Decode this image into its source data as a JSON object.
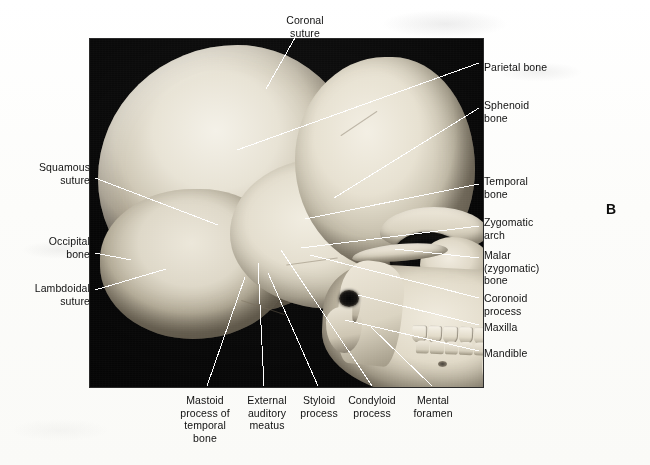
{
  "figure": {
    "letter": "B",
    "caption_labels_present": true
  },
  "photo": {
    "subject": "lateral view of human skull",
    "background_color": "#0a0a0a",
    "bone_color": "#e8e3d5"
  },
  "labels": {
    "top": [
      {
        "id": "coronal-suture",
        "text": "Coronal\nsuture",
        "align": "center",
        "x": 305,
        "y": 14
      }
    ],
    "right": [
      {
        "id": "parietal-bone",
        "text": "Parietal bone",
        "align": "left",
        "x": 484,
        "y": 61
      },
      {
        "id": "sphenoid-bone",
        "text": "Sphenoid\nbone",
        "align": "left",
        "x": 484,
        "y": 99
      },
      {
        "id": "temporal-bone",
        "text": "Temporal\nbone",
        "align": "left",
        "x": 484,
        "y": 175
      },
      {
        "id": "zygomatic-arch",
        "text": "Zygomatic\narch",
        "align": "left",
        "x": 484,
        "y": 216
      },
      {
        "id": "malar-zygomatic-bone",
        "text": "Malar\n(zygomatic)\nbone",
        "align": "left",
        "x": 484,
        "y": 249
      },
      {
        "id": "coronoid-process",
        "text": "Coronoid\nprocess",
        "align": "left",
        "x": 484,
        "y": 292
      },
      {
        "id": "maxilla",
        "text": "Maxilla",
        "align": "left",
        "x": 484,
        "y": 321
      },
      {
        "id": "mandible",
        "text": "Mandible",
        "align": "left",
        "x": 484,
        "y": 347
      }
    ],
    "left": [
      {
        "id": "squamous-suture",
        "text": "Squamous\nsuture",
        "align": "right",
        "x": 90,
        "y": 161
      },
      {
        "id": "occipital-bone",
        "text": "Occipital\nbone",
        "align": "right",
        "x": 90,
        "y": 235
      },
      {
        "id": "lambdoidal-suture",
        "text": "Lambdoidal\nsuture",
        "align": "right",
        "x": 90,
        "y": 282
      }
    ],
    "bottom": [
      {
        "id": "mastoid-process-of-temporal-bone",
        "text": "Mastoid\nprocess of\ntemporal\nbone",
        "align": "center",
        "x": 205,
        "y": 394
      },
      {
        "id": "external-auditory-meatus",
        "text": "External\nauditory\nmeatus",
        "align": "center",
        "x": 267,
        "y": 394
      },
      {
        "id": "styloid-process",
        "text": "Styloid\nprocess",
        "align": "center",
        "x": 319,
        "y": 394
      },
      {
        "id": "condyloid-process",
        "text": "Condyloid\nprocess",
        "align": "center",
        "x": 372,
        "y": 394
      },
      {
        "id": "mental-foramen",
        "text": "Mental\nforamen",
        "align": "center",
        "x": 433,
        "y": 394
      }
    ]
  },
  "leaders": [
    {
      "id": "leader-coronal-suture",
      "x1": 296,
      "y1": 36,
      "x2": 266,
      "y2": 89,
      "color": "#ffffff"
    },
    {
      "id": "leader-parietal-bone",
      "x1": 479,
      "y1": 63,
      "x2": 237,
      "y2": 150,
      "color": "#ffffff"
    },
    {
      "id": "leader-sphenoid-bone",
      "x1": 479,
      "y1": 108,
      "x2": 334,
      "y2": 198,
      "color": "#ffffff"
    },
    {
      "id": "leader-temporal-bone",
      "x1": 479,
      "y1": 184,
      "x2": 305,
      "y2": 219,
      "color": "#ffffff"
    },
    {
      "id": "leader-zygomatic-arch",
      "x1": 479,
      "y1": 226,
      "x2": 301,
      "y2": 248,
      "color": "#ffffff"
    },
    {
      "id": "leader-malar-bone",
      "x1": 479,
      "y1": 258,
      "x2": 395,
      "y2": 249,
      "color": "#ffffff"
    },
    {
      "id": "leader-coronoid-process",
      "x1": 479,
      "y1": 298,
      "x2": 310,
      "y2": 255,
      "color": "#ffffff"
    },
    {
      "id": "leader-maxilla",
      "x1": 479,
      "y1": 325,
      "x2": 358,
      "y2": 295,
      "color": "#ffffff"
    },
    {
      "id": "leader-mandible",
      "x1": 479,
      "y1": 351,
      "x2": 345,
      "y2": 320,
      "color": "#ffffff"
    },
    {
      "id": "leader-squamous-suture",
      "x1": 95,
      "y1": 178,
      "x2": 218,
      "y2": 225,
      "color": "#ffffff"
    },
    {
      "id": "leader-occipital-bone",
      "x1": 95,
      "y1": 253,
      "x2": 131,
      "y2": 260,
      "color": "#ffffff"
    },
    {
      "id": "leader-lambdoidal-suture",
      "x1": 95,
      "y1": 290,
      "x2": 166,
      "y2": 269,
      "color": "#ffffff"
    },
    {
      "id": "leader-mastoid-process",
      "x1": 207,
      "y1": 386,
      "x2": 245,
      "y2": 277,
      "color": "#ffffff"
    },
    {
      "id": "leader-external-meatus",
      "x1": 264,
      "y1": 386,
      "x2": 258,
      "y2": 263,
      "color": "#ffffff"
    },
    {
      "id": "leader-styloid-process",
      "x1": 318,
      "y1": 386,
      "x2": 268,
      "y2": 273,
      "color": "#ffffff"
    },
    {
      "id": "leader-condyloid-process",
      "x1": 372,
      "y1": 386,
      "x2": 281,
      "y2": 250,
      "color": "#ffffff"
    },
    {
      "id": "leader-mental-foramen",
      "x1": 432,
      "y1": 386,
      "x2": 371,
      "y2": 327,
      "color": "#ffffff"
    }
  ],
  "sutures": [
    {
      "id": "coronal-suture-mark",
      "x": 247,
      "y": 84,
      "w": 44,
      "h": 1.2,
      "rot": -34
    },
    {
      "id": "lambdoidal-suture-mark",
      "x": 150,
      "y": 268,
      "w": 46,
      "h": 1.2,
      "rot": 18
    },
    {
      "id": "squamous-suture-mark",
      "x": 196,
      "y": 222,
      "w": 52,
      "h": 1.2,
      "rot": -8
    }
  ]
}
